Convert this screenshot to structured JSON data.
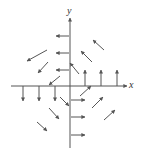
{
  "diagram": {
    "type": "vector-field",
    "axes": {
      "x_label": "x",
      "y_label": "y",
      "origin_px": [
        70,
        86
      ],
      "x_range_px": [
        11,
        127
      ],
      "y_range_px": [
        18,
        148
      ]
    },
    "colors": {
      "stroke": "#555555",
      "background": "#ffffff"
    },
    "vectors": [
      {
        "from": [
          69,
          36
        ],
        "to": [
          56,
          36
        ]
      },
      {
        "from": [
          69,
          53
        ],
        "to": [
          56,
          53
        ]
      },
      {
        "from": [
          69,
          70
        ],
        "to": [
          56,
          70
        ]
      },
      {
        "from": [
          47,
          50
        ],
        "to": [
          27,
          61
        ]
      },
      {
        "from": [
          48,
          62
        ],
        "to": [
          38,
          73
        ]
      },
      {
        "from": [
          60,
          76
        ],
        "to": [
          49,
          85
        ]
      },
      {
        "from": [
          79,
          74
        ],
        "to": [
          70,
          63
        ]
      },
      {
        "from": [
          92,
          62
        ],
        "to": [
          81,
          51
        ]
      },
      {
        "from": [
          104,
          50
        ],
        "to": [
          93,
          40
        ]
      },
      {
        "from": [
          85,
          86
        ],
        "to": [
          85,
          70
        ]
      },
      {
        "from": [
          101,
          86
        ],
        "to": [
          101,
          70
        ]
      },
      {
        "from": [
          117,
          86
        ],
        "to": [
          117,
          70
        ]
      },
      {
        "from": [
          23,
          86
        ],
        "to": [
          23,
          101
        ]
      },
      {
        "from": [
          39,
          86
        ],
        "to": [
          39,
          101
        ]
      },
      {
        "from": [
          55,
          86
        ],
        "to": [
          55,
          101
        ]
      },
      {
        "from": [
          60,
          97
        ],
        "to": [
          69,
          106
        ]
      },
      {
        "from": [
          49,
          108
        ],
        "to": [
          59,
          119
        ]
      },
      {
        "from": [
          37,
          122
        ],
        "to": [
          47,
          131
        ]
      },
      {
        "from": [
          80,
          96
        ],
        "to": [
          91,
          86
        ]
      },
      {
        "from": [
          92,
          108
        ],
        "to": [
          103,
          97
        ]
      },
      {
        "from": [
          104,
          120
        ],
        "to": [
          115,
          110
        ]
      },
      {
        "from": [
          71,
          100
        ],
        "to": [
          85,
          100
        ]
      },
      {
        "from": [
          71,
          117
        ],
        "to": [
          85,
          117
        ]
      },
      {
        "from": [
          71,
          135
        ],
        "to": [
          85,
          135
        ]
      }
    ]
  }
}
